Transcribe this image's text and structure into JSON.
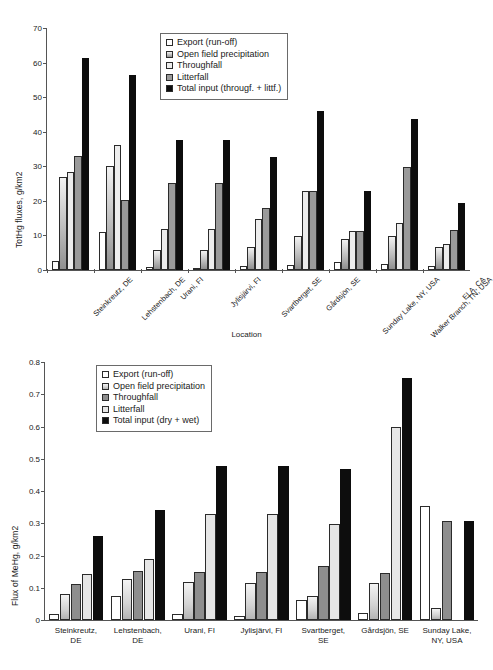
{
  "chart_data": [
    {
      "type": "bar",
      "id": "tothg",
      "title": "",
      "xlabel": "Location",
      "ylabel": "TotHg fluxes, g/km2",
      "ylim": [
        0,
        70
      ],
      "yticks": [
        0,
        10,
        20,
        30,
        40,
        50,
        60,
        70
      ],
      "ytick_labels": [
        "0",
        "10",
        "20",
        "30",
        "40",
        "50",
        "60",
        "70"
      ],
      "grid": false,
      "legend_position": "top-center",
      "categories": [
        "Steinkreutz, DE",
        "Lehstenbach, DE",
        "Urani, FI",
        "Jylisjärvi, FI",
        "Svartberget, SE",
        "Gårdsjön, SE",
        "Sunday Lake, NY, USA",
        "Walker Branch, TN, USA",
        "ELA, CA"
      ],
      "series": [
        {
          "name": "Export (run-off)",
          "key": "export",
          "color": "#ffffff",
          "values": [
            2.5,
            11.0,
            0.8,
            0.5,
            1.3,
            1.4,
            2.3,
            1.7,
            1.2
          ]
        },
        {
          "name": "Open field precipitation",
          "key": "openfield",
          "color": "#bdbdbd",
          "values": [
            27.0,
            30.0,
            5.7,
            5.7,
            6.8,
            9.7,
            9.0,
            9.7,
            6.6
          ]
        },
        {
          "name": "Throughfall",
          "key": "throughfall",
          "color": "#ededed",
          "values": [
            28.3,
            36.3,
            12.0,
            12.0,
            14.8,
            22.8,
            11.4,
            13.7,
            7.6
          ]
        },
        {
          "name": "Litterfall",
          "key": "litterfall",
          "color": "#9a9a9a",
          "values": [
            33.1,
            20.3,
            25.2,
            25.2,
            17.8,
            22.8,
            11.4,
            29.8,
            11.6
          ]
        },
        {
          "name": "Total input (througf. + littf.)",
          "key": "total",
          "color": "#0d0d0d",
          "values": [
            61.3,
            56.5,
            37.5,
            37.5,
            32.8,
            46.0,
            23.0,
            43.8,
            19.5
          ]
        }
      ]
    },
    {
      "type": "bar",
      "id": "mehg",
      "title": "",
      "xlabel": "",
      "ylabel": "Flux of MeHg, g/km2",
      "ylim": [
        0,
        0.8
      ],
      "yticks": [
        0,
        0.1,
        0.2,
        0.3,
        0.4,
        0.5,
        0.6,
        0.7,
        0.8
      ],
      "ytick_labels": [
        "0",
        "0.1",
        "0.2",
        "0.3",
        "0.4",
        "0.5",
        "0.6",
        "0.7",
        "0.8"
      ],
      "grid": false,
      "legend_position": "top-center",
      "categories": [
        "Steinkreutz,\nDE",
        "Lehstenbach,\nDE",
        "Urani, FI",
        "Jylisjärvi, FI",
        "Svartberget,\nSE",
        "Gårdsjön, SE",
        "Sunday Lake,\nNY, USA"
      ],
      "series": [
        {
          "name": "Export (run-off)",
          "key": "export",
          "color": "#ffffff",
          "values": [
            0.02,
            0.075,
            0.018,
            0.013,
            0.062,
            0.022,
            0.355
          ]
        },
        {
          "name": "Open field precipitation",
          "key": "openfield",
          "color": "#d3d3d3",
          "values": [
            0.08,
            0.128,
            0.117,
            0.115,
            0.075,
            0.115,
            0.037
          ]
        },
        {
          "name": "Throughfall",
          "key": "throughfall",
          "color": "#8e8e8e",
          "values": [
            0.113,
            0.152,
            0.148,
            0.148,
            0.166,
            0.146,
            0.306
          ]
        },
        {
          "name": "Litterfall",
          "key": "litterfall",
          "color": "#e6e6e6",
          "values": [
            0.143,
            0.188,
            0.328,
            0.328,
            0.297,
            0.6,
            0.0
          ]
        },
        {
          "name": "Total input (dry + wet)",
          "key": "total",
          "color": "#0d0d0d",
          "values": [
            0.26,
            0.342,
            0.478,
            0.478,
            0.468,
            0.75,
            0.306
          ]
        }
      ]
    }
  ],
  "top_chart": {
    "ylabel": "TotHg fluxes, g/km2",
    "xlabel": "Location",
    "legend": [
      {
        "label": "Export (run-off)",
        "swatch": "sw-export"
      },
      {
        "label": "Open field precipitation",
        "swatch": "sw-openfld"
      },
      {
        "label": "Throughfall",
        "swatch": "sw-through"
      },
      {
        "label": "Litterfall",
        "swatch": "sw-litter"
      },
      {
        "label": "Total input (througf. + littf.)",
        "swatch": "sw-total"
      }
    ]
  },
  "bottom_chart": {
    "ylabel": "Flux of MeHg, g/km2",
    "xlabel": "",
    "legend": [
      {
        "label": "Export (run-off)",
        "swatch": "b-export"
      },
      {
        "label": "Open field precipitation",
        "swatch": "b-openfld"
      },
      {
        "label": "Throughfall",
        "swatch": "b-through"
      },
      {
        "label": "Litterfall",
        "swatch": "b-litter"
      },
      {
        "label": "Total input (dry + wet)",
        "swatch": "b-total"
      }
    ]
  }
}
